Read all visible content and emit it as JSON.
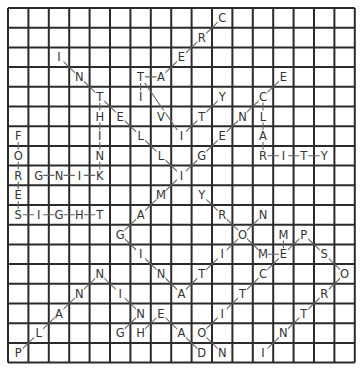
{
  "puzzle": {
    "type": "word-search-solution",
    "cols": 17,
    "rows": 18,
    "origin": [
      8,
      8
    ],
    "cell_w": 20.4,
    "cell_h": 19.7,
    "colors": {
      "grid": "#2b2b2b",
      "letters": "#3a3a3a",
      "lines": "#666666",
      "background": "#ffffff"
    },
    "letters": [
      {
        "r": 0,
        "c": 10,
        "ch": "C"
      },
      {
        "r": 1,
        "c": 9,
        "ch": "R"
      },
      {
        "r": 2,
        "c": 2,
        "ch": "I"
      },
      {
        "r": 2,
        "c": 8,
        "ch": "E"
      },
      {
        "r": 3,
        "c": 3,
        "ch": "N"
      },
      {
        "r": 3,
        "c": 6,
        "ch": "T"
      },
      {
        "r": 3,
        "c": 7,
        "ch": "A"
      },
      {
        "r": 3,
        "c": 13,
        "ch": "E"
      },
      {
        "r": 4,
        "c": 4,
        "ch": "T"
      },
      {
        "r": 4,
        "c": 6,
        "ch": "I"
      },
      {
        "r": 4,
        "c": 10,
        "ch": "Y"
      },
      {
        "r": 4,
        "c": 12,
        "ch": "C"
      },
      {
        "r": 5,
        "c": 4,
        "ch": "H"
      },
      {
        "r": 5,
        "c": 5,
        "ch": "E"
      },
      {
        "r": 5,
        "c": 7,
        "ch": "V"
      },
      {
        "r": 5,
        "c": 9,
        "ch": "T"
      },
      {
        "r": 5,
        "c": 11,
        "ch": "N"
      },
      {
        "r": 5,
        "c": 12,
        "ch": "L"
      },
      {
        "r": 6,
        "c": 0,
        "ch": "F"
      },
      {
        "r": 6,
        "c": 4,
        "ch": "I"
      },
      {
        "r": 6,
        "c": 6,
        "ch": "L"
      },
      {
        "r": 6,
        "c": 8,
        "ch": "I"
      },
      {
        "r": 6,
        "c": 10,
        "ch": "E"
      },
      {
        "r": 6,
        "c": 12,
        "ch": "A"
      },
      {
        "r": 7,
        "c": 0,
        "ch": "O"
      },
      {
        "r": 7,
        "c": 4,
        "ch": "N"
      },
      {
        "r": 7,
        "c": 7,
        "ch": "L"
      },
      {
        "r": 7,
        "c": 9,
        "ch": "G"
      },
      {
        "r": 7,
        "c": 12,
        "ch": "R"
      },
      {
        "r": 7,
        "c": 13,
        "ch": "I"
      },
      {
        "r": 7,
        "c": 14,
        "ch": "T"
      },
      {
        "r": 7,
        "c": 15,
        "ch": "Y"
      },
      {
        "r": 8,
        "c": 0,
        "ch": "R"
      },
      {
        "r": 8,
        "c": 1,
        "ch": "G"
      },
      {
        "r": 8,
        "c": 2,
        "ch": "N"
      },
      {
        "r": 8,
        "c": 3,
        "ch": "I"
      },
      {
        "r": 8,
        "c": 4,
        "ch": "K"
      },
      {
        "r": 8,
        "c": 8,
        "ch": "I"
      },
      {
        "r": 9,
        "c": 0,
        "ch": "E"
      },
      {
        "r": 9,
        "c": 7,
        "ch": "M"
      },
      {
        "r": 9,
        "c": 9,
        "ch": "Y"
      },
      {
        "r": 10,
        "c": 0,
        "ch": "S"
      },
      {
        "r": 10,
        "c": 1,
        "ch": "I"
      },
      {
        "r": 10,
        "c": 2,
        "ch": "G"
      },
      {
        "r": 10,
        "c": 3,
        "ch": "H"
      },
      {
        "r": 10,
        "c": 4,
        "ch": "T"
      },
      {
        "r": 10,
        "c": 6,
        "ch": "A"
      },
      {
        "r": 10,
        "c": 10,
        "ch": "R"
      },
      {
        "r": 10,
        "c": 12,
        "ch": "N"
      },
      {
        "r": 11,
        "c": 5,
        "ch": "G"
      },
      {
        "r": 11,
        "c": 11,
        "ch": "O"
      },
      {
        "r": 11,
        "c": 13,
        "ch": "M"
      },
      {
        "r": 11,
        "c": 14,
        "ch": "P"
      },
      {
        "r": 12,
        "c": 6,
        "ch": "I"
      },
      {
        "r": 12,
        "c": 10,
        "ch": "I"
      },
      {
        "r": 12,
        "c": 12,
        "ch": "M"
      },
      {
        "r": 12,
        "c": 13,
        "ch": "E"
      },
      {
        "r": 12,
        "c": 15,
        "ch": "S"
      },
      {
        "r": 13,
        "c": 4,
        "ch": "N"
      },
      {
        "r": 13,
        "c": 7,
        "ch": "N"
      },
      {
        "r": 13,
        "c": 9,
        "ch": "T"
      },
      {
        "r": 13,
        "c": 12,
        "ch": "C"
      },
      {
        "r": 13,
        "c": 16,
        "ch": "O"
      },
      {
        "r": 14,
        "c": 3,
        "ch": "N"
      },
      {
        "r": 14,
        "c": 5,
        "ch": "I"
      },
      {
        "r": 14,
        "c": 8,
        "ch": "A"
      },
      {
        "r": 14,
        "c": 11,
        "ch": "T"
      },
      {
        "r": 14,
        "c": 15,
        "ch": "R"
      },
      {
        "r": 15,
        "c": 2,
        "ch": "A"
      },
      {
        "r": 15,
        "c": 6,
        "ch": "N"
      },
      {
        "r": 15,
        "c": 7,
        "ch": "E"
      },
      {
        "r": 15,
        "c": 10,
        "ch": "I"
      },
      {
        "r": 15,
        "c": 14,
        "ch": "T"
      },
      {
        "r": 16,
        "c": 1,
        "ch": "L"
      },
      {
        "r": 16,
        "c": 5,
        "ch": "G"
      },
      {
        "r": 16,
        "c": 6,
        "ch": "H"
      },
      {
        "r": 16,
        "c": 8,
        "ch": "A"
      },
      {
        "r": 16,
        "c": 9,
        "ch": "O"
      },
      {
        "r": 16,
        "c": 13,
        "ch": "N"
      },
      {
        "r": 17,
        "c": 0,
        "ch": "P"
      },
      {
        "r": 17,
        "c": 9,
        "ch": "D"
      },
      {
        "r": 17,
        "c": 10,
        "ch": "N"
      },
      {
        "r": 17,
        "c": 12,
        "ch": "I"
      }
    ],
    "words": [
      {
        "word": "CREATIVITY",
        "path": [
          [
            0,
            10
          ],
          [
            3,
            7
          ],
          [
            3,
            6
          ],
          [
            4,
            6
          ],
          [
            4,
            6
          ],
          [
            3,
            6
          ],
          [
            6,
            8
          ],
          [
            4,
            10
          ]
        ]
      },
      {
        "word": "INTELLIGENCE",
        "path": [
          [
            2,
            2
          ],
          [
            8,
            8
          ],
          [
            3,
            13
          ]
        ]
      },
      {
        "word": "CLARITY",
        "path": [
          [
            4,
            12
          ],
          [
            7,
            12
          ],
          [
            7,
            15
          ]
        ]
      },
      {
        "word": "THINKING",
        "path": [
          [
            4,
            4
          ],
          [
            8,
            4
          ],
          [
            8,
            1
          ]
        ]
      },
      {
        "word": "FORESIGHT",
        "path": [
          [
            6,
            0
          ],
          [
            10,
            0
          ],
          [
            10,
            4
          ]
        ]
      },
      {
        "word": "IMAGINATION",
        "path": [
          [
            8,
            8
          ],
          [
            11,
            5
          ],
          [
            14,
            8
          ],
          [
            10,
            12
          ]
        ]
      },
      {
        "word": "MEMORY",
        "path": [
          [
            11,
            13
          ],
          [
            12,
            13
          ],
          [
            12,
            12
          ],
          [
            9,
            9
          ]
        ]
      },
      {
        "word": "PLANNING",
        "path": [
          [
            17,
            0
          ],
          [
            13,
            4
          ],
          [
            15,
            6
          ],
          [
            16,
            5
          ]
        ]
      },
      {
        "word": "INTROSPECTION",
        "path": [
          [
            17,
            12
          ],
          [
            13,
            16
          ],
          [
            11,
            14
          ],
          [
            12,
            13
          ],
          [
            16,
            9
          ],
          [
            17,
            10
          ]
        ]
      },
      {
        "word": "HEAD",
        "path": [
          [
            16,
            6
          ],
          [
            15,
            7
          ],
          [
            17,
            9
          ]
        ]
      }
    ]
  }
}
